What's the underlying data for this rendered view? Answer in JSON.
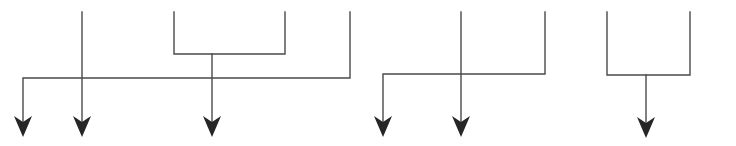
{
  "diagram": {
    "type": "connector-flow",
    "colors": {
      "line": "#4a4a4a",
      "arrowhead": "#262626",
      "background": "#ffffff"
    },
    "groups": [
      {
        "id": "group-1",
        "lines": [
          {
            "id": "g1-vertical-a",
            "points": [
              [
                82,
                12
              ],
              [
                82,
                125
              ]
            ]
          },
          {
            "id": "g1-bracket",
            "points": [
              [
                174,
                12
              ],
              [
                174,
                54
              ],
              [
                285,
                54
              ],
              [
                285,
                12
              ]
            ]
          },
          {
            "id": "g1-bracket-stem",
            "points": [
              [
                212,
                54
              ],
              [
                212,
                125
              ]
            ]
          },
          {
            "id": "g1-right-route",
            "points": [
              [
                350,
                12
              ],
              [
                350,
                78
              ],
              [
                23,
                78
              ],
              [
                23,
                125
              ]
            ]
          }
        ],
        "arrows": [
          {
            "id": "g1-arrow-1",
            "x": 23,
            "y": 137
          },
          {
            "id": "g1-arrow-2",
            "x": 82,
            "y": 137
          },
          {
            "id": "g1-arrow-3",
            "x": 212,
            "y": 137
          }
        ]
      },
      {
        "id": "group-2",
        "lines": [
          {
            "id": "g2-vertical-a",
            "points": [
              [
                461,
                12
              ],
              [
                461,
                125
              ]
            ]
          },
          {
            "id": "g2-right-route",
            "points": [
              [
                545,
                12
              ],
              [
                545,
                74
              ],
              [
                383,
                74
              ],
              [
                383,
                125
              ]
            ]
          }
        ],
        "arrows": [
          {
            "id": "g2-arrow-1",
            "x": 383,
            "y": 137
          },
          {
            "id": "g2-arrow-2",
            "x": 461,
            "y": 137
          }
        ]
      },
      {
        "id": "group-3",
        "lines": [
          {
            "id": "g3-bracket",
            "points": [
              [
                607,
                12
              ],
              [
                607,
                75
              ],
              [
                690,
                75
              ],
              [
                690,
                12
              ]
            ]
          },
          {
            "id": "g3-bracket-stem",
            "points": [
              [
                646,
                75
              ],
              [
                646,
                126
              ]
            ]
          }
        ],
        "arrows": [
          {
            "id": "g3-arrow-1",
            "x": 646,
            "y": 138
          }
        ]
      }
    ]
  }
}
